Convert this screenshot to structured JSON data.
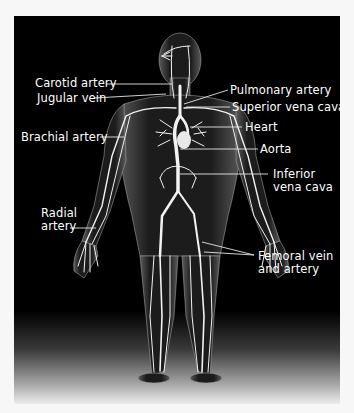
{
  "diagram": {
    "type": "anatomical-illustration",
    "background_color": "#000000",
    "vessel_color": "#ffffff",
    "labels_left": [
      {
        "id": "carotid",
        "text": "Carotid artery"
      },
      {
        "id": "jugular",
        "text": "Jugular vein"
      },
      {
        "id": "brachial",
        "text": "Brachial artery"
      },
      {
        "id": "radial_1",
        "text": "Radial"
      },
      {
        "id": "radial_2",
        "text": "artery"
      }
    ],
    "labels_right": [
      {
        "id": "pulmonary",
        "text": "Pulmonary artery"
      },
      {
        "id": "svc",
        "text": "Superior vena cava"
      },
      {
        "id": "heart",
        "text": "Heart"
      },
      {
        "id": "aorta",
        "text": "Aorta"
      },
      {
        "id": "ivc_1",
        "text": "Inferior"
      },
      {
        "id": "ivc_2",
        "text": "vena cava"
      },
      {
        "id": "femoral_1",
        "text": "Femoral vein"
      },
      {
        "id": "femoral_2",
        "text": "and artery"
      }
    ]
  }
}
